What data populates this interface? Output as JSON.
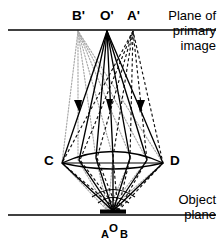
{
  "figure": {
    "background_color": "#ffffff",
    "ink_color": "#000000",
    "gray_ray_color": "#a8a8a8",
    "width": 224,
    "height": 251
  },
  "labels": {
    "image_points": {
      "b_prime": "B'",
      "o_prime": "O'",
      "a_prime": "A'"
    },
    "lens_edges": {
      "left": "C",
      "right": "D"
    },
    "object_points": {
      "a": "A",
      "o": "O",
      "b": "B"
    },
    "planes": {
      "primary_line1": "Plane of",
      "primary_line2": "primary",
      "primary_line3": "image",
      "object_line1": "Object",
      "object_line2": "plane"
    }
  },
  "geometry": {
    "primary_image_plane_y": 30,
    "object_plane_y": 215,
    "lens_left_x": 62,
    "lens_right_x": 163,
    "lens_y": 163,
    "object_center_x": 113,
    "object_bar_y": 212,
    "image_b_prime_x": 78,
    "image_o_prime_x": 107,
    "image_a_prime_x": 133,
    "arrow_y": 104
  },
  "ray_bundles": [
    {
      "name": "ray-bundle-b-prime",
      "style": "dotted",
      "color": "#a8a8a8",
      "from_object_x": 108,
      "to_image_x": 78
    },
    {
      "name": "ray-bundle-o-prime",
      "style": "solid",
      "color": "#000000",
      "from_object_x": 113,
      "to_image_x": 107
    },
    {
      "name": "ray-bundle-a-prime",
      "style": "dashed",
      "color": "#000000",
      "from_object_x": 118,
      "to_image_x": 133
    }
  ]
}
